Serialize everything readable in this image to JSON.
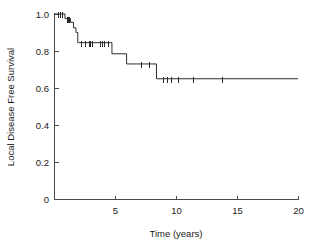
{
  "chart_data": {
    "type": "line",
    "subtype": "kaplan-meier-step",
    "title": "",
    "xlabel": "Time (years)",
    "ylabel": "Local Disease Free Survival",
    "xlim": [
      0,
      20
    ],
    "ylim": [
      0,
      1.0
    ],
    "grid": false,
    "legend": "none",
    "xticks": [
      0,
      5,
      10,
      15,
      20
    ],
    "xtick_labels": [
      "0",
      "5",
      "10",
      "15",
      "20"
    ],
    "yticks": [
      0,
      0.2,
      0.4,
      0.6,
      0.8,
      1.0
    ],
    "ytick_labels": [
      "0",
      "0.2",
      "0.4",
      "0.6",
      "0.8",
      "1.0"
    ],
    "series": [
      {
        "name": "Local disease free survival",
        "step_points": [
          [
            0.0,
            1.0
          ],
          [
            0.9,
            1.0
          ],
          [
            0.95,
            0.975
          ],
          [
            1.35,
            0.975
          ],
          [
            1.4,
            0.955
          ],
          [
            1.6,
            0.955
          ],
          [
            1.65,
            0.925
          ],
          [
            1.8,
            0.925
          ],
          [
            1.85,
            0.9
          ],
          [
            1.95,
            0.9
          ],
          [
            2.0,
            0.845
          ],
          [
            4.75,
            0.845
          ],
          [
            4.8,
            0.785
          ],
          [
            5.95,
            0.785
          ],
          [
            6.0,
            0.73
          ],
          [
            8.4,
            0.73
          ],
          [
            8.45,
            0.65
          ],
          [
            20.0,
            0.65
          ]
        ],
        "censor_points": [
          [
            0.35,
            1.0
          ],
          [
            0.5,
            1.0
          ],
          [
            0.62,
            1.0
          ],
          [
            1.05,
            0.975
          ],
          [
            1.15,
            0.975
          ],
          [
            1.25,
            0.975
          ],
          [
            2.25,
            0.845
          ],
          [
            2.55,
            0.845
          ],
          [
            2.85,
            0.845
          ],
          [
            2.95,
            0.845
          ],
          [
            3.1,
            0.845
          ],
          [
            3.75,
            0.845
          ],
          [
            3.95,
            0.845
          ],
          [
            4.1,
            0.845
          ],
          [
            4.45,
            0.845
          ],
          [
            7.1,
            0.73
          ],
          [
            7.75,
            0.73
          ],
          [
            8.9,
            0.65
          ],
          [
            9.3,
            0.65
          ],
          [
            9.55,
            0.65
          ],
          [
            10.2,
            0.65
          ],
          [
            11.4,
            0.65
          ],
          [
            13.8,
            0.65
          ]
        ]
      }
    ],
    "annotations": {
      "plateau_value": "0.65",
      "initial_value": "1.0",
      "max_followup_years": "20"
    }
  },
  "geometry": {
    "plot_left_px": 54,
    "plot_right_px": 298,
    "plot_top_px": 14,
    "plot_bottom_px": 199,
    "tick_len_px": 4,
    "censor_half_height_px": 3
  },
  "colors": {
    "background": "#ffffff",
    "axis": "#4a4a4a",
    "curve": "#2b2b2b",
    "text": "#1a1a1a"
  }
}
